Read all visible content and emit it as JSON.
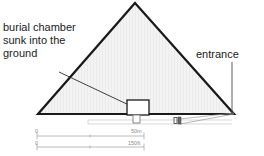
{
  "diagram": {
    "annotations": {
      "burial_chamber": {
        "lines": [
          "burial chamber",
          "sunk into the",
          "ground"
        ],
        "icon": "leader-line-icon"
      },
      "entrance": {
        "label": "entrance",
        "icon": "leader-line-icon"
      }
    },
    "structures": {
      "pyramid": {
        "name": "pyramid-outline",
        "fill": "#f2f2f2",
        "stroke": "#1a1a1a"
      },
      "ground_line": {
        "name": "ground-line",
        "stroke": "#1a1a1a"
      },
      "chamber_box": {
        "name": "burial-chamber-box",
        "fill": "#ffffff",
        "stroke": "#1a1a1a"
      },
      "shaft": {
        "name": "chamber-shaft",
        "stroke": "#6e6e6e"
      },
      "corridor": {
        "name": "entrance-corridor",
        "stroke": "#bdbdbd"
      },
      "passage_marker": {
        "name": "passage-marker",
        "stroke": "#4a4a4a"
      }
    },
    "scale_bars": [
      {
        "name": "metric",
        "zero": "0",
        "max": "50m",
        "ticks": 2
      },
      {
        "name": "imperial",
        "zero": "0",
        "max": "150ft",
        "ticks": 2
      }
    ],
    "colors": {
      "ink": "#1a1a1a",
      "pyramid_fill": "#f2f2f2",
      "scale_gray": "#8a8a8a",
      "corridor_gray": "#bdbdbd"
    }
  }
}
